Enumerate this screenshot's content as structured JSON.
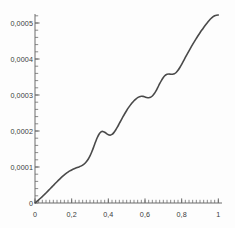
{
  "chart_data": {
    "type": "line",
    "title": "",
    "subtitle": "",
    "xlabel": "",
    "ylabel": "",
    "xlim": [
      0,
      1.02
    ],
    "ylim": [
      0,
      0.000525
    ],
    "grid": false,
    "legend": null,
    "decimal_separator": ",",
    "axis_color": "#6d6d6d",
    "line_color": "#4a4a4a",
    "line_width": 1.6,
    "x_ticks_major": [
      "0",
      "0,2",
      "0,4",
      "0,6",
      "0,8",
      "1"
    ],
    "x_ticks_major_values": [
      0,
      0.2,
      0.4,
      0.6,
      0.8,
      1
    ],
    "x_minor_step": 0.02,
    "y_ticks_major": [
      "0,0001",
      "0,0002",
      "0,0003",
      "0,0004",
      "0,0005"
    ],
    "y_ticks_major_values": [
      0.0001,
      0.0002,
      0.0003,
      0.0004,
      0.0005
    ],
    "y_minor_step": 2e-05,
    "origin_label": "0",
    "series": [
      {
        "name": "staircase",
        "x": [
          0.0,
          0.01,
          0.02,
          0.03,
          0.04,
          0.05,
          0.06,
          0.07,
          0.08,
          0.09,
          0.1,
          0.11,
          0.12,
          0.13,
          0.14,
          0.15,
          0.16,
          0.17,
          0.18,
          0.19,
          0.2,
          0.21,
          0.22,
          0.23,
          0.24,
          0.25,
          0.26,
          0.27,
          0.28,
          0.29,
          0.3,
          0.31,
          0.32,
          0.33,
          0.34,
          0.35,
          0.36,
          0.37,
          0.38,
          0.39,
          0.4,
          0.41,
          0.42,
          0.43,
          0.44,
          0.45,
          0.46,
          0.47,
          0.48,
          0.49,
          0.5,
          0.51,
          0.52,
          0.53,
          0.54,
          0.55,
          0.56,
          0.57,
          0.58,
          0.59,
          0.6,
          0.61,
          0.62,
          0.63,
          0.64,
          0.65,
          0.66,
          0.67,
          0.68,
          0.69,
          0.7,
          0.71,
          0.72,
          0.73,
          0.74,
          0.75,
          0.76,
          0.77,
          0.78,
          0.79,
          0.8,
          0.81,
          0.82,
          0.83,
          0.84,
          0.85,
          0.86,
          0.87,
          0.88,
          0.89,
          0.9,
          0.91,
          0.92,
          0.93,
          0.94,
          0.95,
          0.96,
          0.97,
          0.98,
          0.99,
          1.0
        ],
        "y": [
          0.0,
          4.2e-06,
          8.6e-06,
          1.32e-05,
          1.8e-05,
          2.29e-05,
          2.79e-05,
          3.3e-05,
          3.82e-05,
          4.34e-05,
          4.87e-05,
          5.4e-05,
          5.92e-05,
          6.43e-05,
          6.92e-05,
          7.39e-05,
          7.83e-05,
          8.23e-05,
          8.59e-05,
          8.91e-05,
          9.19e-05,
          9.43e-05,
          9.64e-05,
          9.83e-05,
          0.0001002,
          0.0001024,
          0.0001052,
          0.000109,
          0.0001143,
          0.0001215,
          0.0001308,
          0.0001423,
          0.0001555,
          0.0001693,
          0.000182,
          0.0001918,
          0.0001975,
          0.0001988,
          0.0001966,
          0.0001928,
          0.0001895,
          0.0001885,
          0.0001905,
          0.0001955,
          0.0002028,
          0.0002115,
          0.0002209,
          0.0002304,
          0.0002397,
          0.0002486,
          0.000257,
          0.0002648,
          0.0002719,
          0.0002783,
          0.000284,
          0.0002888,
          0.0002927,
          0.0002953,
          0.0002965,
          0.0002961,
          0.0002947,
          0.0002931,
          0.0002925,
          0.0002937,
          0.0002973,
          0.0003033,
          0.0003115,
          0.0003212,
          0.0003314,
          0.0003409,
          0.0003488,
          0.0003544,
          0.0003574,
          0.0003582,
          0.0003578,
          0.0003575,
          0.0003588,
          0.0003625,
          0.0003686,
          0.0003764,
          0.0003853,
          0.0003947,
          0.0004042,
          0.0004136,
          0.0004228,
          0.0004318,
          0.0004405,
          0.000449,
          0.0004572,
          0.0004652,
          0.0004729,
          0.0004804,
          0.0004876,
          0.0004945,
          0.000501,
          0.000507,
          0.0005124,
          0.0005169,
          0.0005201,
          0.0005217,
          0.0005222
        ]
      }
    ]
  }
}
